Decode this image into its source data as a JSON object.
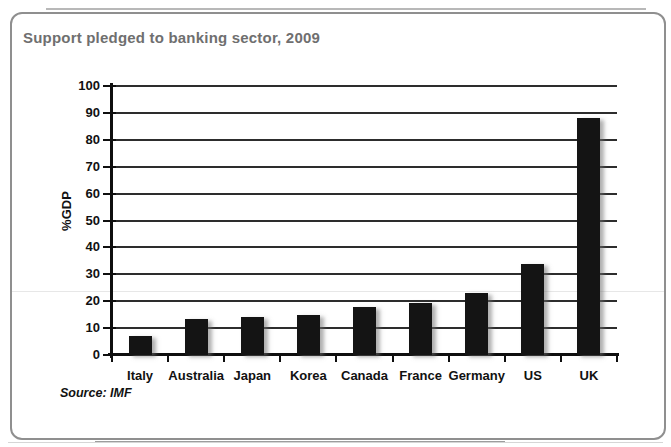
{
  "card": {
    "border_color": "#8f8f8f",
    "title_color": "#6f6f6f"
  },
  "chart_data": {
    "type": "bar",
    "title": "Support pledged to banking sector, 2009",
    "categories": [
      "Italy",
      "Australia",
      "Japan",
      "Korea",
      "Canada",
      "France",
      "Germany",
      "US",
      "UK"
    ],
    "values": [
      7,
      13.5,
      14,
      15,
      18,
      19.5,
      23,
      34,
      88
    ],
    "xlabel": "",
    "ylabel": "%GDP",
    "ylim": [
      0,
      100
    ],
    "ytick_step": 10,
    "grid": "horizontal",
    "legend": "none",
    "bar_color": "#141414",
    "axis_color": "#0f0f0f",
    "source": "Source: IMF"
  }
}
